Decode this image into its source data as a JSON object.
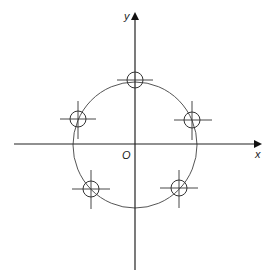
{
  "diagram": {
    "axes": {
      "x_label": "x",
      "y_label": "y",
      "origin_label": "O"
    },
    "circle": {
      "cx": 135,
      "cy": 145,
      "rx": 62,
      "ry": 63
    },
    "markers": [
      {
        "name": "top",
        "cx": 135,
        "cy": 80
      },
      {
        "name": "upper-left",
        "cx": 78,
        "cy": 119
      },
      {
        "name": "upper-right",
        "cx": 192,
        "cy": 120
      },
      {
        "name": "lower-left",
        "cx": 91,
        "cy": 189
      },
      {
        "name": "lower-right",
        "cx": 179,
        "cy": 188
      }
    ],
    "colors": {
      "line": "#222222",
      "circle": "#555555",
      "background": "#ffffff"
    }
  }
}
